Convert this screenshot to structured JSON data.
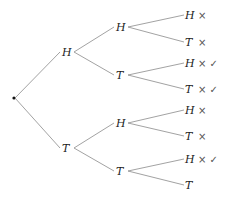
{
  "diagram": {
    "type": "probability-tree",
    "root": {
      "label": ""
    },
    "level1": [
      {
        "label": "H"
      },
      {
        "label": "T"
      }
    ],
    "level2": [
      {
        "label": "H",
        "parent": 0
      },
      {
        "label": "T",
        "parent": 0
      },
      {
        "label": "H",
        "parent": 1
      },
      {
        "label": "T",
        "parent": 1
      }
    ],
    "leaves": [
      {
        "label": "H",
        "parent": 0,
        "marks": "×"
      },
      {
        "label": "T",
        "parent": 0,
        "marks": "×"
      },
      {
        "label": "H",
        "parent": 1,
        "marks": "× ✓"
      },
      {
        "label": "T",
        "parent": 1,
        "marks": "× ✓"
      },
      {
        "label": "H",
        "parent": 2,
        "marks": "×"
      },
      {
        "label": "T",
        "parent": 2,
        "marks": "×"
      },
      {
        "label": "H",
        "parent": 3,
        "marks": "× ✓"
      },
      {
        "label": "T",
        "parent": 3,
        "marks": ""
      }
    ]
  }
}
